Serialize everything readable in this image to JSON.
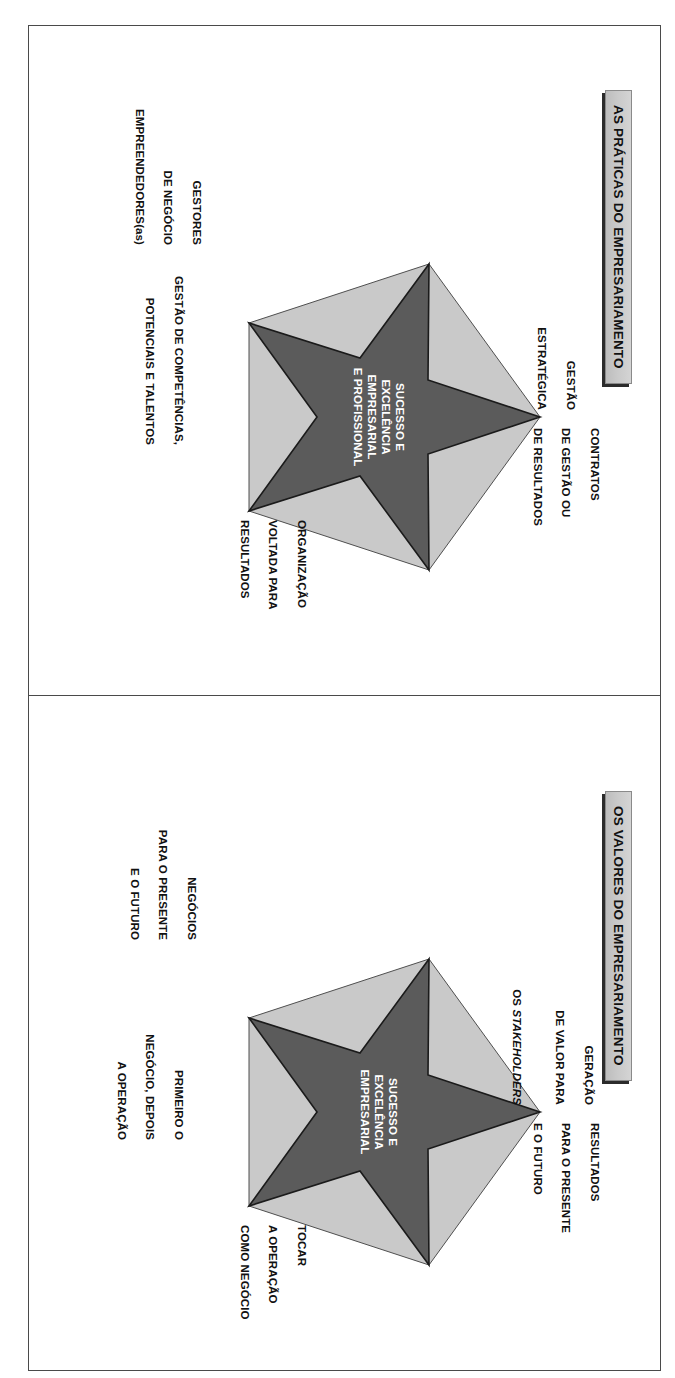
{
  "document": {
    "orientation": "rotated-90-clockwise",
    "frame_color": "#4a4a4a",
    "background": "#ffffff"
  },
  "colors": {
    "pentagon_light": "#c9c9c9",
    "star_dark": "#5b5b5b",
    "star_outline": "#1b1b1b",
    "plaque_fill": "#cccccc",
    "plaque_shadow": "#2b2b2b",
    "text_dark": "#111111",
    "text_light": "#ffffff"
  },
  "panels": [
    {
      "id": "praticas",
      "title": "AS PRÁTICAS DO EMPRESARIAMENTO",
      "center_lines": [
        "SUCESSO E",
        "EXCELÊNCIA",
        "EMPRESARIAL",
        "E PROFISSIONAL"
      ],
      "nodes": [
        {
          "position": "top",
          "lines": [
            "GESTÃO",
            "ESTRATÉGICA"
          ]
        },
        {
          "position": "upper-right",
          "lines": [
            "CONTRATOS",
            "DE GESTÃO OU",
            "DE RESULTADOS"
          ]
        },
        {
          "position": "lower-right",
          "lines": [
            "ORGANIZAÇÃO",
            "VOLTADA PARA",
            "RESULTADOS"
          ]
        },
        {
          "position": "lower-left",
          "lines": [
            "GESTÃO DE COMPETÊNCIAS,",
            "POTENCIAIS E TALENTOS"
          ]
        },
        {
          "position": "upper-left",
          "lines": [
            "GESTORES",
            "DE NEGÓCIO",
            "EMPREENDEDORES(as)"
          ]
        }
      ]
    },
    {
      "id": "valores",
      "title": "OS VALORES DO EMPRESARIAMENTO",
      "center_lines": [
        "SUCESSO E",
        "EXCELÊNCIA",
        "EMPRESARIAL"
      ],
      "nodes": [
        {
          "position": "top",
          "lines": [
            "GERAÇÃO",
            "DE VALOR PARA",
            "OS STAKEHOLDERS"
          ],
          "italic_last_word": "STAKEHOLDERS"
        },
        {
          "position": "upper-right",
          "lines": [
            "RESULTADOS",
            "PARA O PRESENTE",
            "E O FUTURO"
          ]
        },
        {
          "position": "lower-right",
          "lines": [
            "TOCAR",
            "A OPERAÇÃO",
            "COMO NEGÓCIO"
          ]
        },
        {
          "position": "lower-left",
          "lines": [
            "PRIMEIRO O",
            "NEGÓCIO, DEPOIS",
            "A OPERAÇÃO"
          ]
        },
        {
          "position": "upper-left",
          "lines": [
            "NEGÓCIOS",
            "PARA O PRESENTE",
            "E O FUTURO"
          ]
        }
      ]
    }
  ]
}
